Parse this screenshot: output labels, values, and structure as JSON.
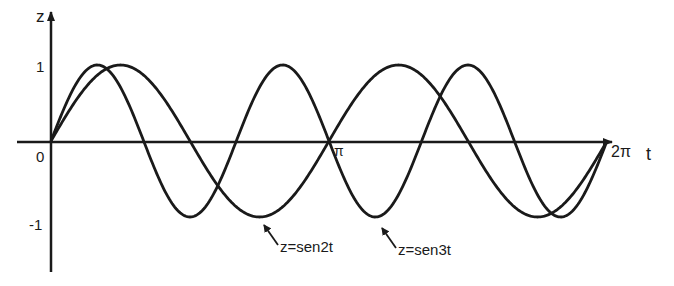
{
  "chart_data": {
    "type": "line",
    "title": "",
    "xlabel": "t",
    "ylabel": "z",
    "x_ticks": [
      {
        "value": 0,
        "label": "0"
      },
      {
        "value": 3.14159,
        "label": "π"
      },
      {
        "value": 6.28318,
        "label": "2π"
      }
    ],
    "y_ticks": [
      {
        "value": 1,
        "label": "1"
      },
      {
        "value": -1,
        "label": "-1"
      }
    ],
    "xlim": [
      0,
      6.28318
    ],
    "ylim": [
      -1,
      1
    ],
    "grid": false,
    "legend": null,
    "series": [
      {
        "name": "z=sen2t",
        "function": "sin(2t)",
        "color": "#1a1a1a"
      },
      {
        "name": "z=sen3t",
        "function": "sin(3t)",
        "color": "#1a1a1a"
      }
    ],
    "annotations": [
      {
        "text": "z=sen2t",
        "points_to_t": 2.356,
        "points_to_z": -1
      },
      {
        "text": "z=sen3t",
        "points_to_t": 3.665,
        "points_to_z": -1
      }
    ]
  },
  "labels": {
    "z_axis": "z",
    "t_axis": "t",
    "origin": "0",
    "pi": "π",
    "two_pi": "2π",
    "one": "1",
    "minus_one": "-1",
    "ann1": "z=sen2t",
    "ann2": "z=sen3t"
  }
}
